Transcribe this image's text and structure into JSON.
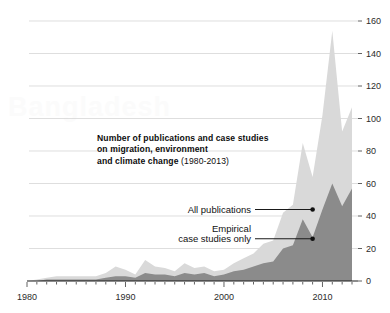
{
  "figure": {
    "title_line1": "Number of publications and case studies",
    "title_line2": "on migration, environment",
    "title_line3": "and climate change",
    "title_years": " (1980-2013)",
    "watermark_text": "Bangladesh"
  },
  "annotations": {
    "all_publications": "All publications",
    "empirical_line1": "Empirical",
    "empirical_line2": "case studies only"
  },
  "colors": {
    "all_publications_fill": "#d9d9d9",
    "empirical_fill": "#8b8b8b",
    "axis": "#1a1a1a",
    "gridline": "#d0d0d0",
    "text": "#111111"
  },
  "chart_data": {
    "type": "area",
    "title": "Number of publications and case studies on migration, environment and climate change (1980-2013)",
    "subtitle": "(1980-2013)",
    "xlabel": "",
    "ylabel": "",
    "xlim": [
      1980,
      2013
    ],
    "ylim": [
      0,
      160
    ],
    "grid": true,
    "legend_position": "inline-annotations",
    "xticks": [
      1980,
      1990,
      2000,
      2010
    ],
    "xtick_labels": [
      "1980",
      "1990",
      "2000",
      "2010"
    ],
    "yticks": [
      0,
      20,
      40,
      60,
      80,
      100,
      120,
      140,
      160
    ],
    "ytick_labels": [
      "0",
      "20",
      "40",
      "60",
      "80",
      "100",
      "120",
      "140",
      "160"
    ],
    "x": [
      1980,
      1981,
      1982,
      1983,
      1984,
      1985,
      1986,
      1987,
      1988,
      1989,
      1990,
      1991,
      1992,
      1993,
      1994,
      1995,
      1996,
      1997,
      1998,
      1999,
      2000,
      2001,
      2002,
      2003,
      2004,
      2005,
      2006,
      2007,
      2008,
      2009,
      2010,
      2011,
      2012,
      2013
    ],
    "series": [
      {
        "name": "All publications",
        "color": "#d9d9d9",
        "values": [
          0,
          1,
          2,
          3,
          3,
          3,
          3,
          3,
          5,
          9,
          7,
          4,
          13,
          9,
          8,
          6,
          11,
          8,
          9,
          6,
          7,
          11,
          14,
          17,
          23,
          25,
          42,
          47,
          85,
          64,
          102,
          154,
          92,
          107
        ]
      },
      {
        "name": "Empirical case studies only",
        "color": "#8b8b8b",
        "values": [
          0,
          0,
          1,
          1,
          1,
          1,
          1,
          1,
          2,
          3,
          3,
          2,
          5,
          4,
          4,
          3,
          5,
          4,
          5,
          3,
          4,
          6,
          7,
          9,
          11,
          12,
          20,
          22,
          38,
          27,
          44,
          60,
          46,
          57
        ]
      }
    ],
    "annotation_points": [
      {
        "label": "All publications",
        "x": 2009,
        "y": 44
      },
      {
        "label": "Empirical case studies only",
        "x": 2009,
        "y": 26
      }
    ]
  }
}
